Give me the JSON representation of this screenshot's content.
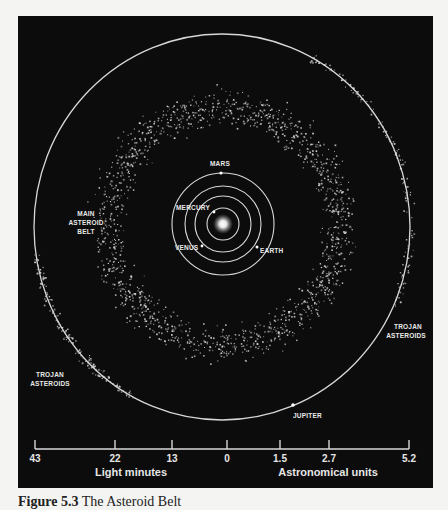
{
  "figure": {
    "caption_number": "Figure 5.3",
    "caption_title": "The Asteroid Belt"
  },
  "colors": {
    "background": "#0c0c0c",
    "orbit": "#d8d8d8",
    "label": "#e8e8e8",
    "asteroid": "#cfcfcf",
    "sun": "#ffffff"
  },
  "labels": {
    "mars": "MARS",
    "mercury": "MERCURY",
    "venus": "VENUS",
    "earth": "EARTH",
    "jupiter": "JUPITER",
    "main_belt_line1": "MAIN",
    "main_belt_line2": "ASTEROID",
    "main_belt_line3": "BELT",
    "trojan_right_line1": "TROJAN",
    "trojan_right_line2": "ASTEROIDS",
    "trojan_left_line1": "TROJAN",
    "trojan_left_line2": "ASTEROIDS"
  },
  "scale": {
    "left_title": "Light minutes",
    "right_title": "Astronomical units",
    "ticks": [
      {
        "label": "43",
        "x": 35
      },
      {
        "label": "22",
        "x": 115
      },
      {
        "label": "13",
        "x": 172
      },
      {
        "label": "0",
        "x": 227
      },
      {
        "label": "1.5",
        "x": 280
      },
      {
        "label": "2.7",
        "x": 329
      },
      {
        "label": "5.2",
        "x": 409
      }
    ]
  },
  "orbits": [
    {
      "name": "Mercury",
      "r": 16
    },
    {
      "name": "Venus",
      "r": 28
    },
    {
      "name": "Earth",
      "r": 38
    },
    {
      "name": "Mars",
      "r": 51
    },
    {
      "name": "Jupiter",
      "rx": 188,
      "ry": 193
    }
  ],
  "belt": {
    "inner_r": 92,
    "outer_r": 140,
    "count": 1500
  },
  "trojans": [
    {
      "name": "leading",
      "start_deg": -62,
      "end_deg": 24,
      "count": 150
    },
    {
      "name": "trailing",
      "start_deg": 118,
      "end_deg": 172,
      "count": 170
    }
  ]
}
